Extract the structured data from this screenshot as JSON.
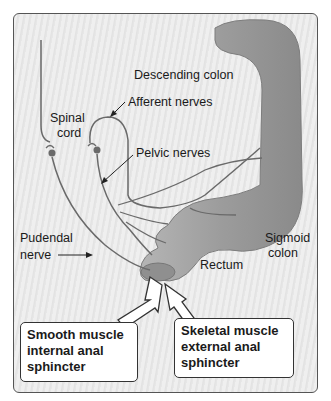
{
  "diagram": {
    "labels": {
      "descending_colon": "Descending colon",
      "afferent_nerves": "Afferent nerves",
      "spinal_cord_line1": "Spinal",
      "spinal_cord_line2": "cord",
      "pelvic_nerves": "Pelvic nerves",
      "pudendal_line1": "Pudendal",
      "pudendal_line2": "nerve",
      "sigmoid_line1": "Sigmoid",
      "sigmoid_line2": "colon",
      "rectum": "Rectum"
    },
    "callouts": {
      "internal": {
        "line1": "Smooth muscle",
        "line2": "internal anal",
        "line3": "sphincter"
      },
      "external": {
        "line1": "Skeletal muscle",
        "line2": "external anal",
        "line3": "sphincter"
      }
    },
    "colors": {
      "colon": "#9a9a9a",
      "nerve": "#6a6a6a",
      "background": "#ececec"
    }
  }
}
